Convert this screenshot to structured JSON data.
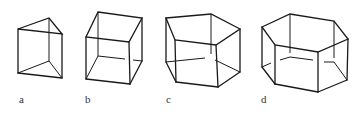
{
  "figures": [
    {
      "id": "a",
      "label": "a",
      "shape": "triangular-prism"
    },
    {
      "id": "b",
      "label": "b",
      "shape": "cube"
    },
    {
      "id": "c",
      "label": "c",
      "shape": "pentagonal-prism"
    },
    {
      "id": "d",
      "label": "d",
      "shape": "hexagonal-prism"
    }
  ],
  "colors": {
    "line": "#1a1a1a",
    "background": "#ffffff",
    "label": "#333333"
  }
}
